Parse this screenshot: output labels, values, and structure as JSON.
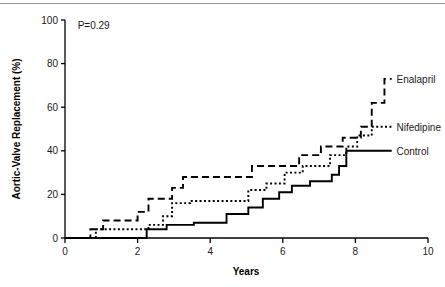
{
  "figure": {
    "background": "#ffffff",
    "ink_color": "#000000",
    "rule_color": "#9a9a9a"
  },
  "chart_data": {
    "type": "line",
    "title": "",
    "xlabel": "Years",
    "ylabel": "Aortic-Valve Replacement (%)",
    "xlim": [
      0,
      10
    ],
    "ylim": [
      0,
      100
    ],
    "xticks": [
      0,
      2,
      4,
      6,
      8,
      10
    ],
    "xticklabels": [
      "0",
      "2",
      "4",
      "6",
      "8",
      "10"
    ],
    "yticks": [
      0,
      20,
      40,
      60,
      80,
      100
    ],
    "yticklabels": [
      "0",
      "20",
      "40",
      "60",
      "80",
      "100"
    ],
    "grid": false,
    "legend_position": "inline-right-of-curve-ends",
    "annotations": [
      {
        "name": "p-value",
        "text": "P=0.29",
        "x": 0.35,
        "y": 96
      }
    ],
    "series": [
      {
        "name": "Enalapril",
        "linestyle": "dashed",
        "color": "#000000",
        "label_x": 9.05,
        "label_y": 73,
        "points": [
          [
            0.0,
            0
          ],
          [
            0.7,
            0
          ],
          [
            0.7,
            4
          ],
          [
            1.05,
            4
          ],
          [
            1.05,
            8
          ],
          [
            2.0,
            8
          ],
          [
            2.0,
            12
          ],
          [
            2.3,
            12
          ],
          [
            2.3,
            18
          ],
          [
            2.95,
            18
          ],
          [
            2.95,
            23
          ],
          [
            3.25,
            23
          ],
          [
            3.25,
            28
          ],
          [
            5.15,
            28
          ],
          [
            5.15,
            33
          ],
          [
            6.45,
            33
          ],
          [
            6.45,
            38
          ],
          [
            7.05,
            38
          ],
          [
            7.05,
            42
          ],
          [
            7.65,
            42
          ],
          [
            7.65,
            46
          ],
          [
            8.15,
            46
          ],
          [
            8.15,
            51
          ],
          [
            8.45,
            51
          ],
          [
            8.45,
            62
          ],
          [
            8.8,
            62
          ],
          [
            8.8,
            73
          ],
          [
            9.0,
            73
          ]
        ]
      },
      {
        "name": "Nifedipine",
        "linestyle": "dotted",
        "color": "#000000",
        "label_x": 9.05,
        "label_y": 51,
        "points": [
          [
            0.0,
            0
          ],
          [
            0.85,
            0
          ],
          [
            0.85,
            4
          ],
          [
            2.3,
            4
          ],
          [
            2.3,
            6
          ],
          [
            2.7,
            6
          ],
          [
            2.7,
            10
          ],
          [
            2.95,
            10
          ],
          [
            2.95,
            16
          ],
          [
            3.45,
            16
          ],
          [
            3.45,
            17
          ],
          [
            5.05,
            17
          ],
          [
            5.05,
            22
          ],
          [
            5.55,
            22
          ],
          [
            5.55,
            25
          ],
          [
            6.05,
            25
          ],
          [
            6.05,
            30
          ],
          [
            6.55,
            30
          ],
          [
            6.55,
            33
          ],
          [
            7.3,
            33
          ],
          [
            7.3,
            38
          ],
          [
            7.75,
            38
          ],
          [
            7.75,
            42
          ],
          [
            8.05,
            42
          ],
          [
            8.05,
            47
          ],
          [
            8.45,
            47
          ],
          [
            8.45,
            51
          ],
          [
            9.0,
            51
          ]
        ]
      },
      {
        "name": "Control",
        "linestyle": "solid",
        "color": "#000000",
        "label_x": 9.05,
        "label_y": 40,
        "points": [
          [
            0.0,
            0
          ],
          [
            2.25,
            0
          ],
          [
            2.25,
            4
          ],
          [
            2.8,
            4
          ],
          [
            2.8,
            6
          ],
          [
            3.55,
            6
          ],
          [
            3.55,
            7
          ],
          [
            4.45,
            7
          ],
          [
            4.45,
            11
          ],
          [
            5.05,
            11
          ],
          [
            5.05,
            14
          ],
          [
            5.45,
            14
          ],
          [
            5.45,
            18
          ],
          [
            5.9,
            18
          ],
          [
            5.9,
            21
          ],
          [
            6.25,
            21
          ],
          [
            6.25,
            24
          ],
          [
            6.75,
            24
          ],
          [
            6.75,
            26
          ],
          [
            7.35,
            26
          ],
          [
            7.35,
            29
          ],
          [
            7.55,
            29
          ],
          [
            7.55,
            33
          ],
          [
            7.75,
            33
          ],
          [
            7.75,
            40
          ],
          [
            9.0,
            40
          ]
        ]
      }
    ]
  }
}
